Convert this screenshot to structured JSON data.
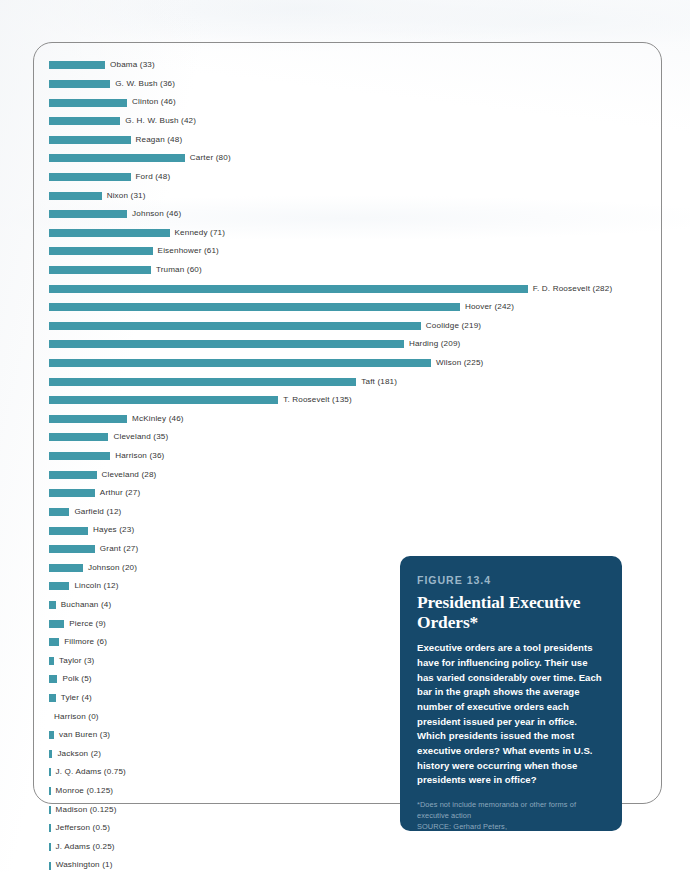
{
  "figure": {
    "eyebrow": "FIGURE 13.4",
    "title": "Presidential Executive Orders*",
    "body": "Executive orders are a tool presidents have for influencing policy. Their use has varied considerably over time. Each bar in the graph shows the average number of executive orders each president issued per year in office. Which presidents issued the most executive orders? What events in U.S. history were occurring when those presidents were in office?",
    "footnote": "*Does not include memoranda or other forms of executive action",
    "source": "SOURCE: Gerhard Peters, www.presidency.ucsb.edu/data/orders.php (accessed 6/1/16).",
    "bar_color": "#4199a9",
    "callout_color": "#16496b",
    "label_color": "#353535",
    "eyebrow_color": "#9bb6c8",
    "note_color": "#8ca8bd"
  },
  "chart_data": {
    "type": "bar",
    "orientation": "horizontal",
    "title": "Presidential Executive Orders*",
    "xlabel": "",
    "ylabel": "",
    "xlim": [
      0,
      282
    ],
    "grid": false,
    "legend": null,
    "value_unit": "average executive orders per year in office",
    "categories": [
      "Obama",
      "G. W. Bush",
      "Clinton",
      "G. H. W. Bush",
      "Reagan",
      "Carter",
      "Ford",
      "Nixon",
      "Johnson",
      "Kennedy",
      "Eisenhower",
      "Truman",
      "F. D. Roosevelt",
      "Hoover",
      "Coolidge",
      "Harding",
      "Wilson",
      "Taft",
      "T. Roosevelt",
      "McKinley",
      "Cleveland",
      "Harrison",
      "Cleveland",
      "Arthur",
      "Garfield",
      "Hayes",
      "Grant",
      "Johnson",
      "Lincoln",
      "Buchanan",
      "Pierce",
      "Fillmore",
      "Taylor",
      "Polk",
      "Tyler",
      "Harrison",
      "van Buren",
      "Jackson",
      "J. Q. Adams",
      "Monroe",
      "Madison",
      "Jefferson",
      "J. Adams",
      "Washington"
    ],
    "values": [
      33,
      36,
      46,
      42,
      48,
      80,
      48,
      31,
      46,
      71,
      61,
      60,
      282,
      242,
      219,
      209,
      225,
      181,
      135,
      46,
      35,
      36,
      28,
      27,
      12,
      23,
      27,
      20,
      12,
      4,
      9,
      6,
      3,
      5,
      4,
      0,
      3,
      2,
      0.75,
      0.125,
      0.125,
      0.5,
      0.25,
      1
    ],
    "labels": [
      "Obama (33)",
      "G. W. Bush (36)",
      "Clinton (46)",
      "G. H. W. Bush (42)",
      "Reagan (48)",
      "Carter (80)",
      "Ford (48)",
      "Nixon (31)",
      "Johnson (46)",
      "Kennedy (71)",
      "Eisenhower (61)",
      "Truman (60)",
      "F. D. Roosevelt (282)",
      "Hoover (242)",
      "Coolidge (219)",
      "Harding (209)",
      "Wilson (225)",
      "Taft (181)",
      "T. Roosevelt (135)",
      "McKinley (46)",
      "Cleveland (35)",
      "Harrison (36)",
      "Cleveland (28)",
      "Arthur (27)",
      "Garfield (12)",
      "Hayes (23)",
      "Grant (27)",
      "Johnson (20)",
      "Lincoln (12)",
      "Buchanan (4)",
      "Pierce (9)",
      "Fillmore (6)",
      "Taylor (3)",
      "Polk (5)",
      "Tyler (4)",
      "Harrison (0)",
      "van Buren (3)",
      "Jackson (2)",
      "J. Q. Adams (0.75)",
      "Monroe (0.125)",
      "Madison (0.125)",
      "Jefferson (0.5)",
      "J. Adams (0.25)",
      "Washington (1)"
    ]
  }
}
